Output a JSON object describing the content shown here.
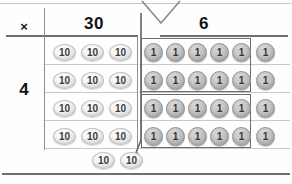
{
  "diagram": {
    "header": {
      "operator_symbol": "×",
      "place_value_columns": [
        "30",
        "6"
      ]
    },
    "row_factor": "4",
    "tens_column": {
      "chip_label": "10",
      "rows": 4,
      "per_row": 3,
      "total_chips": 12
    },
    "ones_column": {
      "chip_label": "1",
      "rows": 4,
      "per_row": 6,
      "total_chips": 24,
      "grouped_per_box": 10,
      "groups": 2
    },
    "regrouped": {
      "chip_label": "10",
      "count": 2,
      "chips": [
        "10",
        "10"
      ]
    },
    "annotations": {
      "vee_label": "place-value-bracket",
      "arrow_label": "regroup-arrow"
    },
    "colors": {
      "rule": "#8d8d8d",
      "rule_strong": "#6f6f6f",
      "rule_faint": "#c9c9c9",
      "text": "#121212",
      "ten_chip": "#e2e2e2",
      "one_chip": "#b4b4b4",
      "page": "#fefefe"
    }
  }
}
